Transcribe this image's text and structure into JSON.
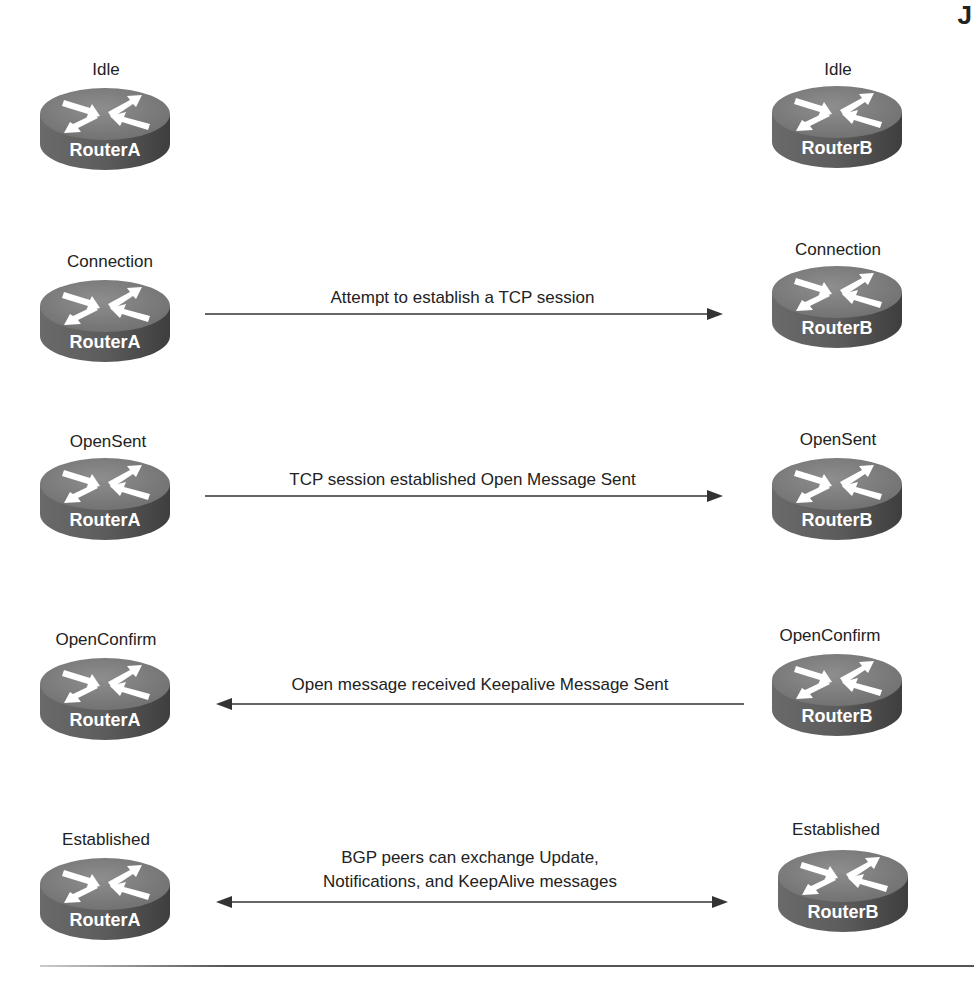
{
  "diagram": {
    "corner_glyph": "J",
    "rows": [
      {
        "left_state": "Idle",
        "left_router": "RouterA",
        "right_state": "Idle",
        "right_router": "RouterB",
        "message": null,
        "direction": "none"
      },
      {
        "left_state": "Connection",
        "left_router": "RouterA",
        "right_state": "Connection",
        "right_router": "RouterB",
        "message": "Attempt to establish a TCP session",
        "direction": "right"
      },
      {
        "left_state": "OpenSent",
        "left_router": "RouterA",
        "right_state": "OpenSent",
        "right_router": "RouterB",
        "message": "TCP session established Open Message Sent",
        "direction": "right"
      },
      {
        "left_state": "OpenConfirm",
        "left_router": "RouterA",
        "right_state": "OpenConfirm",
        "right_router": "RouterB",
        "message": "Open message received Keepalive Message Sent",
        "direction": "left"
      },
      {
        "left_state": "Established",
        "left_router": "RouterA",
        "right_state": "Established",
        "right_router": "RouterB",
        "message_line1": "BGP peers can exchange Update,",
        "message_line2": "Notifications, and KeepAlive messages",
        "direction": "both"
      }
    ],
    "colors": {
      "router_top": "#7a7a7a",
      "router_side": "#5a5a5a",
      "router_text": "#ffffff",
      "line": "#333333"
    }
  }
}
